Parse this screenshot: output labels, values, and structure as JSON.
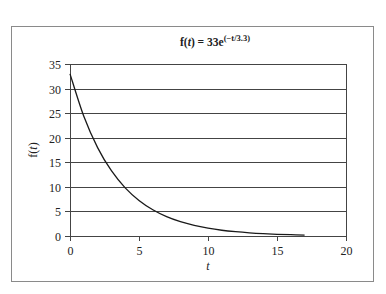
{
  "chart_data": {
    "type": "line",
    "title": {
      "prefix": "f(",
      "var": "t",
      "mid": ") = 33e",
      "exponent": "(−t/3.3)"
    },
    "title_text": "f(t) = 33e^(−t/3.3)",
    "xlabel": "t",
    "ylabel": {
      "prefix": "f(",
      "var": "t",
      "suffix": ")"
    },
    "xlim": [
      0,
      20
    ],
    "ylim": [
      0,
      35
    ],
    "xticks": [
      0,
      5,
      10,
      15,
      20
    ],
    "yticks": [
      0,
      5,
      10,
      15,
      20,
      25,
      30,
      35
    ],
    "xtick_labels": [
      "0",
      "5",
      "10",
      "15",
      "20"
    ],
    "ytick_labels": [
      "0",
      "5",
      "10",
      "15",
      "20",
      "25",
      "30",
      "35"
    ],
    "grid": "horizontal",
    "legend": "none",
    "series": [
      {
        "name": "f(t) = 33e^(-t/3.3)",
        "x": [
          0,
          1,
          2,
          3,
          4,
          5,
          6,
          7,
          8,
          9,
          10,
          11,
          12,
          13,
          14,
          15,
          16,
          17
        ],
        "y": [
          33.0,
          24.36,
          17.99,
          13.28,
          9.8,
          7.24,
          5.34,
          3.94,
          2.91,
          2.15,
          1.59,
          1.17,
          0.87,
          0.64,
          0.47,
          0.35,
          0.26,
          0.19
        ]
      }
    ]
  },
  "colors": {
    "line": "#1a1a1a",
    "grid": "#444444",
    "frame": "#8a8a8a",
    "text": "#222222"
  }
}
